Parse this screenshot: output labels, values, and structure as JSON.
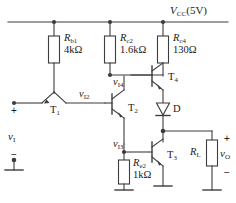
{
  "figure": {
    "type": "circuit-schematic",
    "line_color": "#3d3d3d",
    "text_color": "#1a1a1a",
    "background": "#ffffff"
  },
  "supply": {
    "name": "V",
    "subscript": "CC",
    "value": "(5V)",
    "full": "VCC(5V)"
  },
  "resistors": [
    {
      "id": "Rb1",
      "name": "R",
      "subscript": "b1",
      "value": "4kΩ"
    },
    {
      "id": "Rc2",
      "name": "R",
      "subscript": "c2",
      "value": "1.6kΩ"
    },
    {
      "id": "Rc4",
      "name": "R",
      "subscript": "c4",
      "value": "130Ω"
    },
    {
      "id": "Re2",
      "name": "R",
      "subscript": "e2",
      "value": "1kΩ"
    },
    {
      "id": "RL",
      "name": "R",
      "subscript": "L",
      "value": ""
    }
  ],
  "transistors": [
    {
      "id": "T1",
      "name": "T",
      "subscript": "1"
    },
    {
      "id": "T2",
      "name": "T",
      "subscript": "2"
    },
    {
      "id": "T3",
      "name": "T",
      "subscript": "3"
    },
    {
      "id": "T4",
      "name": "T",
      "subscript": "4"
    }
  ],
  "diode": {
    "id": "D",
    "label": "D"
  },
  "nodes": [
    {
      "id": "vI2",
      "name": "v",
      "subscript": "I2"
    },
    {
      "id": "vI3",
      "name": "v",
      "subscript": "I3"
    },
    {
      "id": "vI4",
      "name": "v",
      "subscript": "I4"
    }
  ],
  "ports": {
    "input": {
      "name": "v",
      "subscript": "I",
      "plus": "+",
      "minus": "−"
    },
    "output": {
      "name": "v",
      "subscript": "O",
      "plus": "+",
      "minus": "−"
    }
  }
}
